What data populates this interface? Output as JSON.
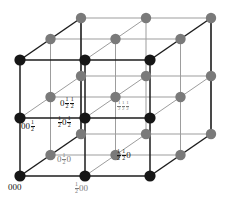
{
  "figure": {
    "type": "crystal-lattice-diagram",
    "colors": {
      "near_atom": "#161616",
      "far_atom": "#7a7a7a",
      "near_edge": "#1d1d1d",
      "far_edge": "#9a9a9a",
      "background": "#ffffff"
    }
  },
  "labels": [
    {
      "id": "origin",
      "text": "000",
      "parts": [
        "0",
        "0",
        "0"
      ],
      "tone": "dark",
      "x": 8,
      "y": 185
    },
    {
      "id": "half-0-0",
      "text": "½00",
      "parts": [
        "1/2",
        "0",
        "0"
      ],
      "tone": "gray",
      "x": 74,
      "y": 186
    },
    {
      "id": "0-half-0",
      "text": "0½0",
      "parts": [
        "0",
        "1/2",
        "0"
      ],
      "tone": "gray",
      "x": 57,
      "y": 156
    },
    {
      "id": "half-half-0",
      "text": "½½0",
      "parts": [
        "1/2",
        "1/2",
        "0"
      ],
      "tone": "dark",
      "x": 114,
      "y": 152
    },
    {
      "id": "0-0-half",
      "text": "00½",
      "parts": [
        "0",
        "0",
        "1/2"
      ],
      "tone": "dark",
      "x": 21,
      "y": 122
    },
    {
      "id": "half-0-half",
      "text": "½0½",
      "parts": [
        "1/2",
        "0",
        "1/2"
      ],
      "tone": "dark",
      "x": 57,
      "y": 118
    },
    {
      "id": "0-half-half",
      "text": "0½½",
      "parts": [
        "0",
        "1/2",
        "1/2"
      ],
      "tone": "dark",
      "x": 60,
      "y": 99
    },
    {
      "id": "half-half-half",
      "text": "½½½",
      "parts": [
        "1/2",
        "1/2",
        "1/2"
      ],
      "tone": "gray",
      "x": 116,
      "y": 103
    }
  ],
  "geometry": {
    "front_bottom_left": {
      "x": 20,
      "y": 176
    },
    "front_top_left": {
      "x": 20,
      "y": 60
    },
    "front_bottom_right": {
      "x": 150,
      "y": 176
    },
    "front_top_right": {
      "x": 150,
      "y": 60
    },
    "depth_dx": 61,
    "depth_dy": -42,
    "atom_radius_near": 5.4,
    "atom_radius_far": 5.0
  },
  "atoms": {
    "near_plane_count": 9,
    "mid_plane_count": 8,
    "far_plane_count": 9,
    "total": 26
  }
}
